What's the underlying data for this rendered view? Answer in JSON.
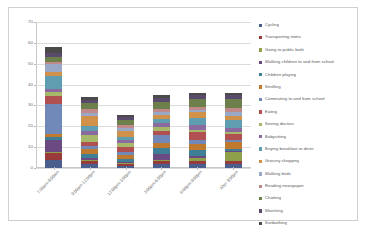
{
  "chart": {
    "type": "stacked-bar",
    "title": "",
    "xlabel": "",
    "ylabel": ""
  },
  "axis": {
    "y_ticks": [
      "0",
      "10",
      "20",
      "30",
      "40",
      "50",
      "60",
      "70"
    ],
    "y_min": 0,
    "y_max": 70
  },
  "chart_data": {
    "type": "bar",
    "subtype": "stacked",
    "title": "",
    "xlabel": "",
    "ylabel": "",
    "ylim": [
      0,
      70
    ],
    "grid": true,
    "legend_position": "right",
    "categories": [
      "7:30am-9:00am",
      "9:00am-12:00pm",
      "12:00pm-3:00pm",
      "3:00pm-6:00pm",
      "6:00pm-9:00pm",
      "After 9:00pm"
    ],
    "series": [
      {
        "name": "Cycling",
        "color": "#4a5f8e",
        "values": [
          4.0,
          2.0,
          1.0,
          2.0,
          2.0,
          2.0
        ]
      },
      {
        "name": "Transporting items",
        "color": "#9a3b3b",
        "values": [
          3.0,
          1.5,
          1.0,
          1.5,
          1.5,
          1.5
        ]
      },
      {
        "name": "Going to public bath",
        "color": "#8fa04a",
        "values": [
          0.5,
          0.5,
          0.5,
          0.5,
          1.5,
          4.0
        ]
      },
      {
        "name": "Walking children to and from school",
        "color": "#6b4a82",
        "values": [
          6.0,
          1.0,
          0.5,
          2.5,
          1.0,
          0.5
        ]
      },
      {
        "name": "Children playing",
        "color": "#3f7f96",
        "values": [
          1.5,
          1.5,
          1.5,
          3.0,
          2.5,
          1.0
        ]
      },
      {
        "name": "Strolling",
        "color": "#c07a30",
        "values": [
          1.5,
          2.5,
          2.0,
          2.5,
          3.0,
          3.5
        ]
      },
      {
        "name": "Commuting  to and from school",
        "color": "#7189b8",
        "values": [
          14.0,
          1.5,
          1.0,
          4.0,
          2.0,
          1.0
        ]
      },
      {
        "name": "Eating",
        "color": "#b05050",
        "values": [
          4.0,
          2.0,
          2.5,
          2.0,
          4.0,
          3.0
        ]
      },
      {
        "name": "Seeing doctors",
        "color": "#a8b86a",
        "values": [
          2.0,
          3.5,
          2.0,
          1.5,
          1.0,
          1.0
        ]
      },
      {
        "name": "Babysitting",
        "color": "#8b6aa0",
        "values": [
          1.5,
          2.0,
          1.5,
          2.0,
          2.0,
          1.5
        ]
      },
      {
        "name": "Buying breakfast or diner",
        "color": "#5f9db0",
        "values": [
          6.0,
          2.0,
          1.5,
          2.0,
          3.5,
          4.0
        ]
      },
      {
        "name": "Grocery shopping",
        "color": "#d0924a",
        "values": [
          2.0,
          5.0,
          3.0,
          2.0,
          3.0,
          2.0
        ]
      },
      {
        "name": "Walking birds",
        "color": "#9aa8c8",
        "values": [
          4.0,
          1.5,
          1.0,
          1.5,
          1.0,
          2.0
        ]
      },
      {
        "name": "Reading newspaper",
        "color": "#c08a8a",
        "values": [
          1.0,
          2.0,
          1.5,
          1.5,
          1.5,
          2.0
        ]
      },
      {
        "name": "Chatting",
        "color": "#6d7f4a",
        "values": [
          2.5,
          2.5,
          2.5,
          3.0,
          3.5,
          4.0
        ]
      },
      {
        "name": "Watching",
        "color": "#5a4a6b",
        "values": [
          1.5,
          1.5,
          1.5,
          2.0,
          2.0,
          2.0
        ]
      },
      {
        "name": "Sunbathing",
        "color": "#4a4a4a",
        "values": [
          3.0,
          1.5,
          1.0,
          1.5,
          1.0,
          1.0
        ]
      }
    ],
    "totals": [
      58.0,
      34.0,
      24.5,
      35.0,
      36.0,
      36.0
    ]
  },
  "legend": {
    "items": [
      {
        "label": "Cycling"
      },
      {
        "label": "Transporting items"
      },
      {
        "label": "Going to public bath"
      },
      {
        "label": "Walking children to and from school"
      },
      {
        "label": "Children playing"
      },
      {
        "label": "Strolling"
      },
      {
        "label": "Commuting  to and from school"
      },
      {
        "label": "Eating"
      },
      {
        "label": "Seeing doctors"
      },
      {
        "label": "Babysitting"
      },
      {
        "label": "Buying breakfast or diner"
      },
      {
        "label": "Grocery shopping"
      },
      {
        "label": "Walking birds"
      },
      {
        "label": "Reading newspaper"
      },
      {
        "label": "Chatting"
      },
      {
        "label": "Watching"
      },
      {
        "label": "Sunbathing"
      }
    ]
  }
}
